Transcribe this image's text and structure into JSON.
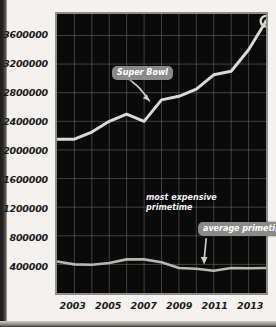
{
  "chart_data": {
    "type": "line",
    "title": "",
    "xlabel": "",
    "ylabel": "",
    "xlim": [
      2002,
      2014
    ],
    "ylim": [
      0,
      3900000
    ],
    "grid": true,
    "legend_position": "annotations-inline",
    "x": [
      2002,
      2003,
      2004,
      2005,
      2006,
      2007,
      2008,
      2009,
      2010,
      2011,
      2012,
      2013,
      2014
    ],
    "y_ticks": [
      400000,
      800000,
      1200000,
      1600000,
      2000000,
      2400000,
      2800000,
      3200000,
      3600000
    ],
    "y_tick_labels": [
      "400000",
      "800000",
      "1200000",
      "1600000",
      "2000000",
      "2400000",
      "2800000",
      "3200000",
      "3600000"
    ],
    "x_ticks": [
      2003,
      2005,
      2007,
      2009,
      2011,
      2013
    ],
    "x_tick_labels": [
      "2003",
      "2005",
      "2007",
      "2009",
      "2011",
      "2013"
    ],
    "series": [
      {
        "name": "most expensive primetime",
        "color": "#d9d9d5",
        "values": [
          2150000,
          2150000,
          2250000,
          2400000,
          2500000,
          2400000,
          2700000,
          2750000,
          2850000,
          3050000,
          3100000,
          3400000,
          3800000
        ],
        "end_marker": "circle"
      },
      {
        "name": "average primetime",
        "color": "#b8b8b2",
        "values": [
          440000,
          400000,
          395000,
          420000,
          470000,
          470000,
          430000,
          350000,
          340000,
          310000,
          350000,
          345000,
          350000
        ]
      }
    ],
    "annotations": [
      {
        "name": "super-bowl",
        "label": "Super Bowl",
        "style": "pill",
        "arrow": "curved-right-down"
      },
      {
        "name": "most-expensive-primetime",
        "label": "most expensive\nprimetime",
        "style": "plain"
      },
      {
        "name": "average-primetime",
        "label": "average\nprimetime",
        "style": "pill",
        "arrow": "down"
      }
    ],
    "colors": {
      "panel_background": "#0a0a0a",
      "grid": "#6f6f6b",
      "page_background": "#f3f2ee",
      "pill": "#8a8a88",
      "text": "#1a1a1a"
    }
  }
}
